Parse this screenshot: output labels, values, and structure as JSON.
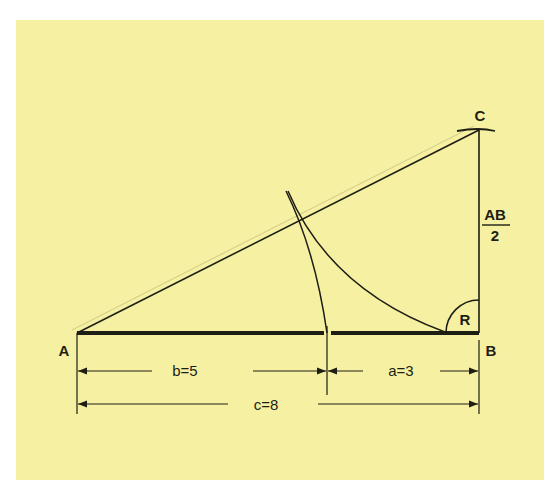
{
  "diagram": {
    "type": "right-triangle golden-section construction",
    "background_color": "#f6f1a2",
    "line_color": "#1e1e14",
    "points": {
      "A": {
        "label": "A",
        "x": 77,
        "y": 333
      },
      "B": {
        "label": "B",
        "x": 479,
        "y": 333
      },
      "C": {
        "label": "C",
        "x": 479,
        "y": 130
      },
      "D": {
        "x": 327,
        "y": 333
      }
    },
    "labels": {
      "A": "A",
      "B": "B",
      "C": "C",
      "right_angle": "R",
      "bc_numerator": "AB",
      "bc_denominator": "2"
    },
    "dimensions": {
      "b": {
        "label": "b=5",
        "from": "A",
        "to": "D"
      },
      "a": {
        "label": "a=3",
        "from": "D",
        "to": "B"
      },
      "c": {
        "label": "c=8",
        "from": "A",
        "to": "B"
      }
    }
  }
}
